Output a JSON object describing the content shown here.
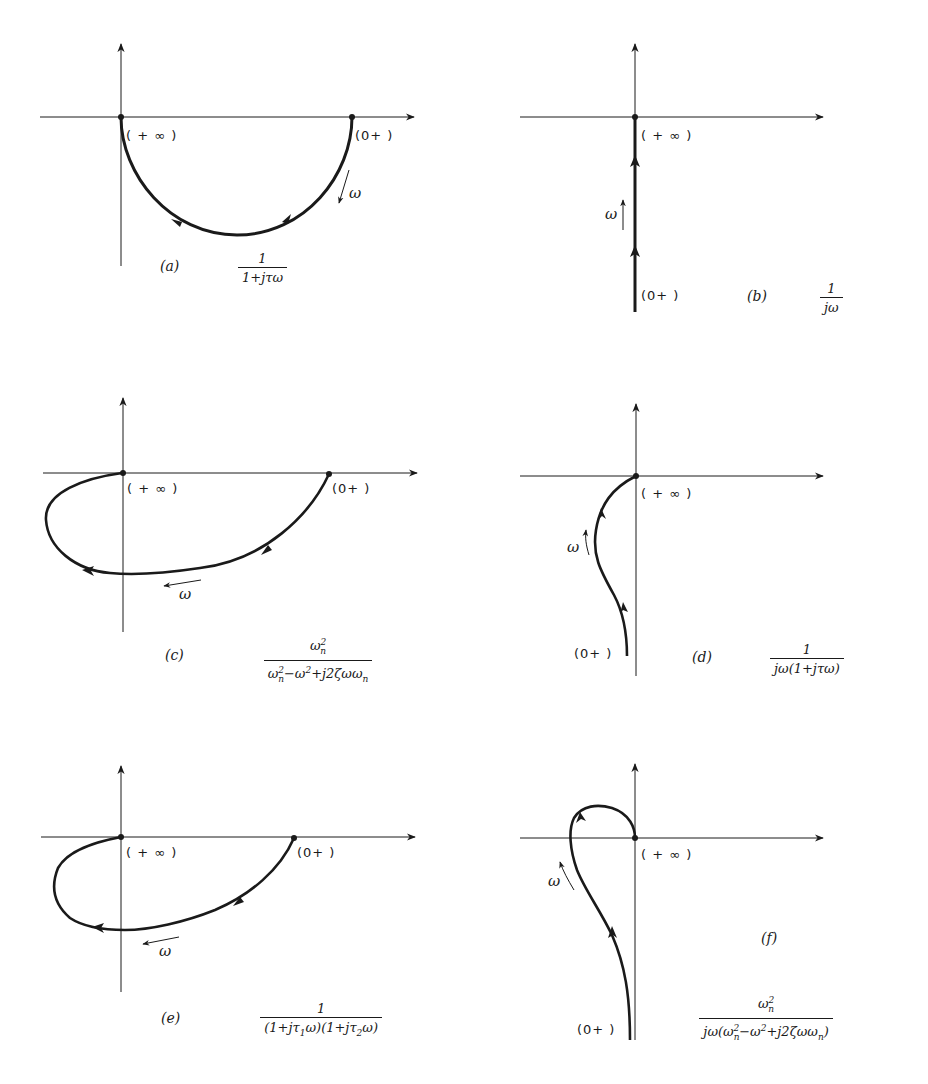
{
  "figure": {
    "colors": {
      "ink": "#1a1a1a",
      "background": "#ffffff"
    },
    "panels": [
      {
        "id": "a",
        "caption": "(a)",
        "function": {
          "numerator": "1",
          "denominator": "1+jτω"
        },
        "points": {
          "start": "(0+)",
          "end": "(+∞)"
        },
        "direction_label": "ω",
        "shape": "semicircle in lower half plane from (1,0) to origin"
      },
      {
        "id": "b",
        "caption": "(b)",
        "function": {
          "numerator": "1",
          "denominator": "jω"
        },
        "points": {
          "start": "(0+)",
          "end": "(+∞)"
        },
        "direction_label": "ω",
        "shape": "negative imaginary axis approaching origin"
      },
      {
        "id": "c",
        "caption": "(c)",
        "function": {
          "numerator": "ωn2",
          "denominator": "ωn2−ω2+j2ζωωn"
        },
        "points": {
          "start": "(0+)",
          "end": "(+∞)"
        },
        "direction_label": "ω",
        "shape": "loop through third quadrant into origin"
      },
      {
        "id": "d",
        "caption": "(d)",
        "function": {
          "numerator": "1",
          "denominator": "jω(1+jτω)"
        },
        "points": {
          "start": "(0+)",
          "end": "(+∞)"
        },
        "direction_label": "ω",
        "shape": "curve from -j∞ asymptote into origin"
      },
      {
        "id": "e",
        "caption": "(e)",
        "function": {
          "numerator": "1",
          "denominator": "(1+jτ1ω)(1+jτ2ω)"
        },
        "points": {
          "start": "(0+)",
          "end": "(+∞)"
        },
        "direction_label": "ω",
        "shape": "loop through third quadrant into origin"
      },
      {
        "id": "f",
        "caption": "(f)",
        "function": {
          "numerator": "ωn2",
          "denominator": "jω(ωn2−ω2+j2ζωωn)"
        },
        "points": {
          "start": "(0+)",
          "end": "(+∞)"
        },
        "direction_label": "ω",
        "shape": "curve from -j∞ looping through second quadrant into origin"
      }
    ]
  },
  "labels": {
    "plus_inf": "( + ∞ )",
    "zero_plus": "(0+ )",
    "omega": "ω",
    "cap_a": "(a)",
    "cap_b": "(b)",
    "cap_c": "(c)",
    "cap_d": "(d)",
    "cap_e": "(e)",
    "cap_f": "(f)",
    "one": "1",
    "den_a": "1+jτω",
    "den_b": "jω",
    "den_d": "jω(1+jτω)",
    "omega_n": "ω",
    "n": "n",
    "two": "2"
  }
}
